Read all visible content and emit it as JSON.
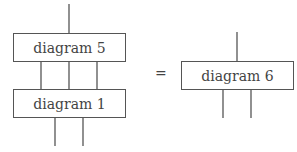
{
  "left": {
    "top_box": {
      "label": "diagram 5"
    },
    "bottom_box": {
      "label": "diagram 1"
    }
  },
  "equals": "=",
  "right": {
    "box": {
      "label": "diagram 6"
    }
  }
}
